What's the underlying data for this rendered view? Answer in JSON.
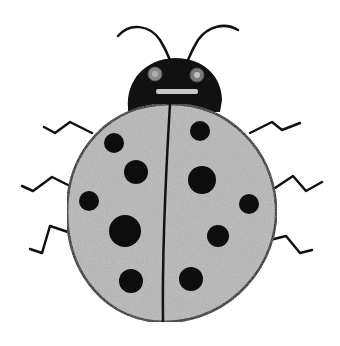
{
  "image": {
    "subject": "Hand-drawn ladybug",
    "style": "black and white pencil drawing",
    "colors": {
      "background": "#ffffff",
      "ink": "#111111",
      "shell": "#b8b8b8",
      "eye": "#8a8a8a"
    },
    "legs_per_side": 3,
    "spots": {
      "left": [
        {
          "cx": 114,
          "cy": 143,
          "r": 10
        },
        {
          "cx": 136,
          "cy": 172,
          "r": 12
        },
        {
          "cx": 89,
          "cy": 201,
          "r": 10
        },
        {
          "cx": 125,
          "cy": 231,
          "r": 16
        },
        {
          "cx": 131,
          "cy": 281,
          "r": 12
        }
      ],
      "right": [
        {
          "cx": 200,
          "cy": 131,
          "r": 10
        },
        {
          "cx": 202,
          "cy": 180,
          "r": 14
        },
        {
          "cx": 249,
          "cy": 204,
          "r": 10
        },
        {
          "cx": 218,
          "cy": 236,
          "r": 11
        },
        {
          "cx": 191,
          "cy": 279,
          "r": 12
        }
      ]
    }
  }
}
